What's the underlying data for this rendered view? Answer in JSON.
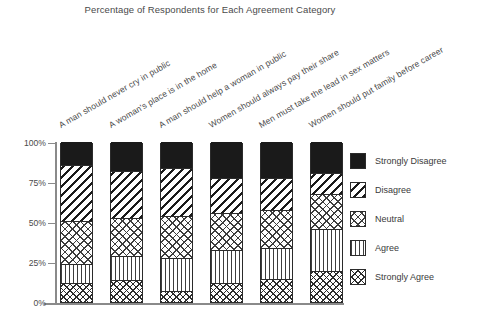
{
  "chart_data": {
    "type": "bar",
    "subtype": "stacked-bar-100-percent",
    "title": "Percentage of Respondents for Each Agreement Category",
    "xlabel": "",
    "ylabel": "",
    "ylim": [
      0,
      100
    ],
    "ytick_labels": [
      "0%",
      "25%",
      "50%",
      "75%",
      "100%"
    ],
    "ytick_values": [
      0,
      25,
      50,
      75,
      100
    ],
    "grid": false,
    "legend_position": "right",
    "categories": [
      "A man should never cry in public",
      "A woman's place is in the home",
      "A man should help a woman in public",
      "Women should always pay their share",
      "Men must take the lead in sex matters",
      "Women should put family before career"
    ],
    "series": [
      {
        "name": "Strongly Agree",
        "pattern": "cross-hatch-dense",
        "values": [
          11,
          13,
          6,
          11,
          14,
          19
        ]
      },
      {
        "name": "Agree",
        "pattern": "vertical-lines",
        "values": [
          12,
          15,
          21,
          21,
          19,
          26
        ]
      },
      {
        "name": "Neutral",
        "pattern": "cross-hatch",
        "values": [
          27,
          24,
          26,
          23,
          24,
          22
        ]
      },
      {
        "name": "Disagree",
        "pattern": "diagonal-lines",
        "values": [
          35,
          29,
          30,
          22,
          20,
          13
        ]
      },
      {
        "name": "Strongly Disagree",
        "pattern": "solid-black",
        "values": [
          15,
          19,
          17,
          23,
          23,
          20
        ]
      }
    ]
  },
  "legend": {
    "items": [
      {
        "label": "Strongly Disagree",
        "pattern": "solid-black"
      },
      {
        "label": "Disagree",
        "pattern": "diagonal-lines"
      },
      {
        "label": "Neutral",
        "pattern": "cross-hatch"
      },
      {
        "label": "Agree",
        "pattern": "vertical-lines"
      },
      {
        "label": "Strongly Agree",
        "pattern": "cross-hatch-dense"
      }
    ]
  },
  "colors": {
    "ink": "#1a1a1a",
    "axis": "#8a8a8a",
    "text": "#4a4a4a",
    "background": "#ffffff"
  }
}
